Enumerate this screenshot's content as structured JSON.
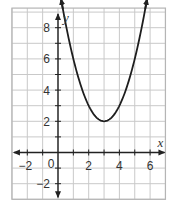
{
  "chart_data": {
    "type": "line",
    "title": "",
    "xlabel": "x",
    "ylabel": "y",
    "xlim": [
      -3,
      7
    ],
    "ylim": [
      -3,
      9
    ],
    "grid": true,
    "grid_step": 1,
    "x_ticks": [
      -2,
      0,
      2,
      4,
      6
    ],
    "y_ticks": [
      -2,
      2,
      4,
      6,
      8
    ],
    "x_tick_labels": [
      "−2",
      "0",
      "2",
      "4",
      "6"
    ],
    "y_tick_labels": [
      "−2",
      "2",
      "4",
      "6",
      "8"
    ],
    "series": [
      {
        "name": "parabola",
        "equation": "y = (x - 3)^2 + 2",
        "vertex": [
          3,
          2
        ],
        "x": [
          0.2,
          1,
          2,
          3,
          4,
          5,
          5.8
        ],
        "y": [
          9.84,
          6,
          3,
          2,
          3,
          6,
          9.84
        ],
        "arrows_at_ends": true
      }
    ],
    "legend": null
  },
  "colors": {
    "grid": "#c9c9c9",
    "border": "#b5b5b5",
    "axis": "#222222",
    "curve": "#1e1e1e",
    "text": "#333333"
  }
}
